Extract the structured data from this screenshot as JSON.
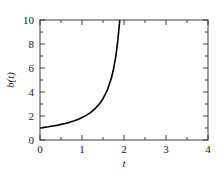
{
  "chart_data": {
    "type": "line",
    "title": "",
    "xlabel": "t",
    "ylabel": "b(t)",
    "xlim": [
      0,
      4
    ],
    "ylim": [
      0,
      10
    ],
    "grid": false,
    "legend": null,
    "xticks": [
      "0",
      "1",
      "2",
      "3",
      "4"
    ],
    "xtick_values": [
      0,
      1,
      2,
      3,
      4
    ],
    "yticks": [
      "0",
      "2",
      "4",
      "6",
      "8",
      "10"
    ],
    "ytick_values": [
      0,
      2,
      4,
      6,
      8,
      10
    ],
    "x_minor_step": 0.5,
    "y_minor_step": 1,
    "series": [
      {
        "name": "b(t)",
        "color": "#000000",
        "x": [
          0.0,
          0.1,
          0.2,
          0.3,
          0.4,
          0.5,
          0.6,
          0.7,
          0.8,
          0.9,
          1.0,
          1.1,
          1.2,
          1.3,
          1.4,
          1.5,
          1.6,
          1.7,
          1.75,
          1.8,
          1.85,
          1.9,
          1.94,
          1.97,
          2.0,
          2.02,
          2.04
        ],
        "values": [
          1.0,
          1.05,
          1.1,
          1.16,
          1.22,
          1.3,
          1.38,
          1.47,
          1.58,
          1.71,
          1.87,
          2.05,
          2.28,
          2.57,
          2.94,
          3.44,
          4.13,
          5.17,
          5.9,
          6.87,
          8.2,
          10.0,
          12.5,
          15.5,
          20.0,
          24.0,
          30.0
        ]
      }
    ]
  },
  "axes": {
    "y_label": "b(t)",
    "x_label": "t"
  }
}
